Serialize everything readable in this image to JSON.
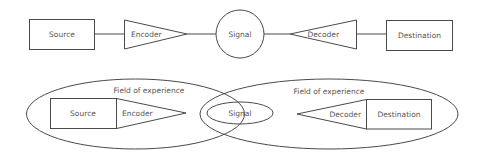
{
  "diagram": {
    "colors": {
      "stroke": "#4a4a4a",
      "text": "#555555",
      "background": "#ffffff"
    },
    "linear_model": {
      "nodes": [
        {
          "id": "source",
          "shape": "rectangle",
          "label": "Source"
        },
        {
          "id": "encoder",
          "shape": "triangle-right",
          "label": "Encoder"
        },
        {
          "id": "signal",
          "shape": "circle",
          "label": "Signal"
        },
        {
          "id": "decoder",
          "shape": "triangle-left",
          "label": "Decoder"
        },
        {
          "id": "destination",
          "shape": "rectangle",
          "label": "Destination"
        }
      ],
      "edges": [
        [
          "source",
          "encoder"
        ],
        [
          "encoder",
          "signal"
        ],
        [
          "signal",
          "decoder"
        ],
        [
          "decoder",
          "destination"
        ]
      ]
    },
    "experience_model": {
      "left_field": {
        "label": "Field of experience",
        "nodes": [
          {
            "id": "source2",
            "shape": "rectangle",
            "label": "Source"
          },
          {
            "id": "encoder2",
            "shape": "triangle-right",
            "label": "Encoder"
          }
        ]
      },
      "overlap": {
        "node": {
          "id": "signal2",
          "shape": "ellipse",
          "label": "Signal"
        }
      },
      "right_field": {
        "label": "Field of experience",
        "nodes": [
          {
            "id": "decoder2",
            "shape": "triangle-left",
            "label": "Decoder"
          },
          {
            "id": "destination2",
            "shape": "rectangle",
            "label": "Destination"
          }
        ]
      }
    }
  }
}
